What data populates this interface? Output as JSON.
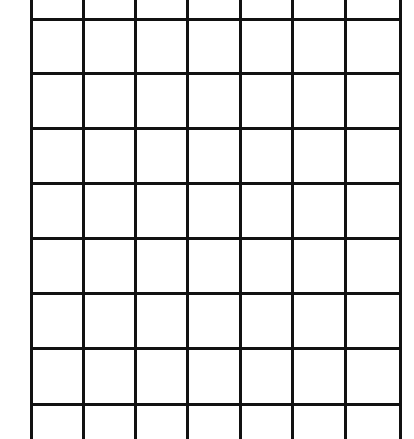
{
  "grid": {
    "line_color": "#111111",
    "background": "#ffffff",
    "columns": 7,
    "visible_rows": 9,
    "vertical_lines_x": [
      31,
      83,
      135,
      187,
      240,
      292,
      345,
      400
    ],
    "horizontal_lines_y": [
      19,
      73,
      128,
      183,
      238,
      293,
      348,
      404
    ],
    "top": -4,
    "bottom": 439
  }
}
